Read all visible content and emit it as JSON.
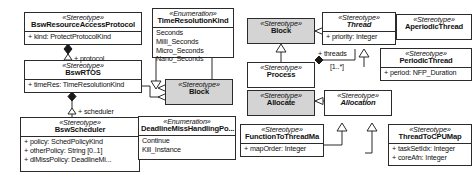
{
  "diagram": {
    "type": "uml-class-diagram",
    "background": "#ffffff",
    "line_color": "#2b2b2b",
    "highlight_fill": "#d4d4d4"
  },
  "nodes": {
    "bsw_resource_access_protocol": {
      "stereotype": "«Stereotype»",
      "name": "BswResourceAccessProtocol",
      "attributes": [
        "+ kind: ProtectProtocolKind"
      ]
    },
    "bsw_rtos": {
      "stereotype": "«Stereotype»",
      "name": "BswRTOS",
      "attributes": [
        "+ timeRes: TimeResolutionKind"
      ]
    },
    "bsw_scheduler": {
      "stereotype": "«Stereotype»",
      "name": "BswScheduler",
      "attributes": [
        "+ policy: SchedPolicyKind",
        "+ otherPolicy: String [0..1]",
        "+ dlMissPolicy: DeadlineMi..."
      ]
    },
    "time_resolution_kind": {
      "stereotype": "«Enumeration»",
      "name": "TimeResolutionKind",
      "literals": [
        "Seconds",
        "Milli_Seconds",
        "Micro_Seconds",
        "Nano_Seconds"
      ]
    },
    "deadline_miss_handling_policy": {
      "stereotype": "«Enumeration»",
      "name": "DeadlineMissHandlingPo...",
      "literals": [
        "Continue",
        "Kill_Instance"
      ]
    },
    "block_left": {
      "stereotype": "«Stereotype»",
      "name": "Block"
    },
    "block_center": {
      "stereotype": "«Stereotype»",
      "name": "Block"
    },
    "process": {
      "stereotype": "«Stereotype»",
      "name": "Process"
    },
    "thread": {
      "stereotype": "«Stereotype»",
      "name": "Thread",
      "abstract": true,
      "attributes": [
        "+ priority: Integer"
      ]
    },
    "aperiodic_thread": {
      "stereotype": "«Stereotype»",
      "name": "AperiodicThread"
    },
    "periodic_thread": {
      "stereotype": "«Stereotype»",
      "name": "PeriodicThread",
      "attributes": [
        "+ period: NFP_Duration"
      ]
    },
    "allocate": {
      "stereotype": "«Stereotype»",
      "name": "Allocate"
    },
    "allocation": {
      "stereotype": "«Stereotype»",
      "name": "Allocation",
      "abstract": true
    },
    "function_to_thread_map": {
      "stereotype": "«Stereotype»",
      "name": "FunctionToThreadMa",
      "attributes": [
        "+ mapOrder: Integer"
      ]
    },
    "thread_to_cpu_map": {
      "stereotype": "«Stereotype»",
      "name": "ThreadToCPUMap",
      "attributes": [
        "+ taskSetIdx: Integer",
        "+ coreAfn: Integer"
      ]
    }
  },
  "edge_labels": {
    "protocol": "+ protocol",
    "scheduler": "+ scheduler",
    "threads": "+ threads",
    "threads_multiplicity": "[1..*]"
  }
}
